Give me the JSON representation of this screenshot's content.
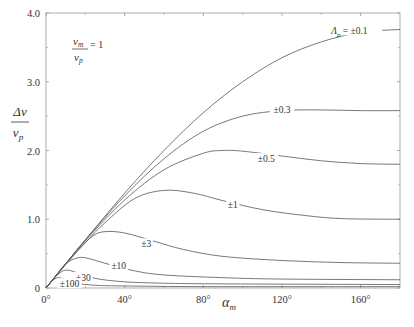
{
  "chart_data": {
    "type": "line",
    "title": "",
    "xlabel": "α_m",
    "ylabel": "Δv / v_p",
    "xlim": [
      0,
      180
    ],
    "ylim": [
      0,
      4.0
    ],
    "grid": false,
    "legend_position": "none (inline curve labels)",
    "annotation": "v_m / v_p = 1",
    "x_ticks": [
      0,
      40,
      80,
      120,
      160
    ],
    "x_tick_labels": [
      "0°",
      "40°",
      "80°",
      "120°",
      "160°"
    ],
    "y_ticks": [
      0,
      1.0,
      2.0,
      3.0,
      4.0
    ],
    "y_tick_labels": [
      "0",
      "1.0",
      "2.0",
      "3.0",
      "4.0"
    ],
    "series": [
      {
        "name": "Λp = ±0.1",
        "label": "Λ_p = ±0.1",
        "x": [
          0,
          10,
          20,
          40,
          60,
          80,
          100,
          120,
          140,
          160,
          180
        ],
        "values": [
          0,
          0.35,
          0.7,
          1.38,
          2.0,
          2.55,
          3.0,
          3.35,
          3.58,
          3.72,
          3.76
        ]
      },
      {
        "name": "±0.3",
        "label": "±0.3",
        "x": [
          0,
          10,
          20,
          40,
          60,
          80,
          100,
          120,
          140,
          160,
          180
        ],
        "values": [
          0,
          0.35,
          0.7,
          1.34,
          1.88,
          2.28,
          2.5,
          2.58,
          2.59,
          2.58,
          2.58
        ]
      },
      {
        "name": "±0.5",
        "label": "±0.5",
        "x": [
          0,
          10,
          20,
          40,
          60,
          80,
          90,
          100,
          120,
          140,
          160,
          180
        ],
        "values": [
          0,
          0.35,
          0.69,
          1.28,
          1.72,
          1.96,
          2.0,
          1.99,
          1.92,
          1.85,
          1.81,
          1.8
        ]
      },
      {
        "name": "±1",
        "label": "±1",
        "x": [
          0,
          10,
          20,
          30,
          45,
          60,
          75,
          90,
          110,
          130,
          150,
          180
        ],
        "values": [
          0,
          0.34,
          0.66,
          0.95,
          1.3,
          1.42,
          1.38,
          1.27,
          1.14,
          1.06,
          1.01,
          1.0
        ]
      },
      {
        "name": "±3",
        "label": "±3",
        "x": [
          0,
          8,
          16,
          24,
          30,
          40,
          55,
          70,
          90,
          120,
          150,
          180
        ],
        "values": [
          0,
          0.28,
          0.55,
          0.76,
          0.82,
          0.8,
          0.68,
          0.56,
          0.46,
          0.4,
          0.37,
          0.36
        ]
      },
      {
        "name": "±10",
        "label": "±10",
        "x": [
          0,
          5,
          10,
          15,
          20,
          30,
          45,
          60,
          90,
          120,
          180
        ],
        "values": [
          0,
          0.18,
          0.35,
          0.43,
          0.44,
          0.36,
          0.25,
          0.19,
          0.15,
          0.13,
          0.12
        ]
      },
      {
        "name": "±30",
        "label": "±30",
        "x": [
          0,
          4,
          8,
          11,
          15,
          25,
          40,
          60,
          90,
          180
        ],
        "values": [
          0,
          0.14,
          0.24,
          0.26,
          0.23,
          0.14,
          0.09,
          0.07,
          0.06,
          0.05
        ]
      },
      {
        "name": "±100",
        "label": "±100",
        "x": [
          0,
          3,
          6,
          9,
          15,
          25,
          40,
          80,
          180
        ],
        "values": [
          0,
          0.1,
          0.15,
          0.13,
          0.07,
          0.04,
          0.03,
          0.02,
          0.02
        ]
      }
    ],
    "curve_label_positions": [
      {
        "series": 0,
        "x": 145,
        "y": 3.72,
        "anchor": "start"
      },
      {
        "series": 1,
        "x": 120,
        "y": 2.58,
        "anchor": "middle"
      },
      {
        "series": 2,
        "x": 112,
        "y": 1.86,
        "anchor": "middle"
      },
      {
        "series": 3,
        "x": 95,
        "y": 1.19,
        "anchor": "middle"
      },
      {
        "series": 4,
        "x": 51,
        "y": 0.62,
        "anchor": "middle"
      },
      {
        "series": 5,
        "x": 37,
        "y": 0.3,
        "anchor": "middle"
      },
      {
        "series": 6,
        "x": 19,
        "y": 0.13,
        "anchor": "middle"
      },
      {
        "series": 7,
        "x": 12,
        "y": 0.04,
        "anchor": "middle"
      }
    ]
  },
  "labels": {
    "y_axis_numerator": "Δv",
    "y_axis_denominator": "v",
    "y_axis_denominator_sub": "p",
    "x_axis_main": "α",
    "x_axis_sub": "m",
    "annot_numerator": "v",
    "annot_numerator_sub": "m",
    "annot_denominator": "v",
    "annot_denominator_sub": "p",
    "annot_equals": "= 1"
  },
  "style": {
    "line_color": "#555555",
    "axis_color": "#999999",
    "text_color": "#333333"
  }
}
